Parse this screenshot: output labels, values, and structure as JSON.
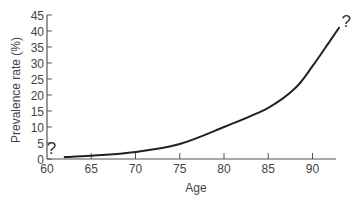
{
  "chart_data": {
    "type": "line",
    "title": "",
    "xlabel": "Age",
    "ylabel": "Prevalence rate (%)",
    "xlim": [
      60,
      94
    ],
    "ylim": [
      0,
      45
    ],
    "x_ticks": [
      60,
      65,
      70,
      75,
      80,
      85,
      90
    ],
    "y_ticks": [
      0,
      5,
      10,
      15,
      20,
      25,
      30,
      35,
      40,
      45
    ],
    "grid": false,
    "legend": null,
    "series": [
      {
        "name": "Prevalence",
        "x": [
          62,
          65,
          70,
          75,
          80,
          85,
          88,
          90,
          92,
          93
        ],
        "values": [
          0.6,
          1.0,
          2.2,
          4.7,
          10,
          16,
          22,
          29,
          37,
          41
        ]
      }
    ],
    "annotations": [
      {
        "text": "?",
        "x": 60.5,
        "y": 3.5,
        "note": "uncertain lower end"
      },
      {
        "text": "?",
        "x": 93.8,
        "y": 43,
        "note": "uncertain upper end"
      }
    ]
  },
  "colors": {
    "line": "#222222",
    "axis": "#555555",
    "text": "#444444",
    "background": "#ffffff"
  }
}
